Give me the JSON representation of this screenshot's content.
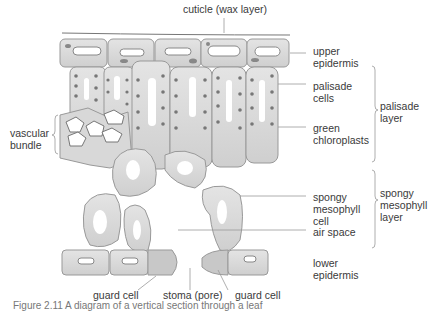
{
  "title": "cuticle (wax layer)",
  "labels": {
    "cuticle": "cuticle (wax layer)",
    "upper_epidermis": "upper\nepidermis",
    "palisade_cells": "palisade\ncells",
    "green_chloroplasts": "green\nchloroplasts",
    "palisade_layer": "palisade\nlayer",
    "vascular_bundle": "vascular\nbundle",
    "spongy_cell": "spongy\nmesophyll\ncell",
    "air_space": "air space",
    "spongy_layer": "spongy\nmesophyll\nlayer",
    "lower_epidermis": "lower\nepidermis",
    "guard_cell_left": "guard cell",
    "stoma": "stoma (pore)",
    "guard_cell_right": "guard cell"
  },
  "caption": "Figure 2.11 A diagram of a vertical section through a leaf",
  "colors": {
    "cell_fill": "#d9d9d9",
    "cell_stroke": "#8a8a8a",
    "chloroplast": "#6f6f6f",
    "guard_fill": "#c4c4c4"
  }
}
